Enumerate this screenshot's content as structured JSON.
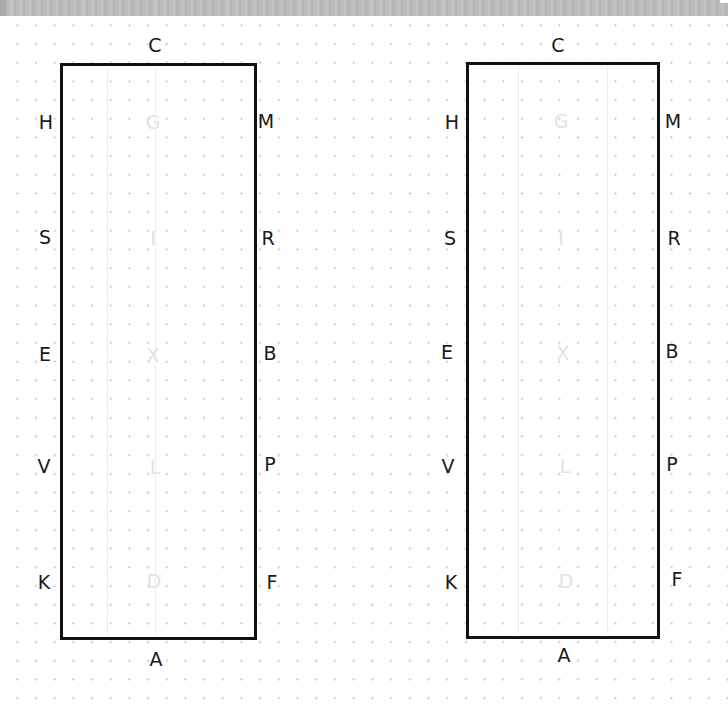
{
  "title_bar": {
    "visible": true
  },
  "arenas": [
    {
      "name": "arena-left",
      "outer_letters": {
        "top": "C",
        "bottom": "A",
        "left": [
          "H",
          "S",
          "E",
          "V",
          "K"
        ],
        "right": [
          "M",
          "R",
          "B",
          "P",
          "F"
        ]
      },
      "centerline_letters": [
        "G",
        "I",
        "X",
        "L",
        "D"
      ]
    },
    {
      "name": "arena-right",
      "outer_letters": {
        "top": "C",
        "bottom": "A",
        "left": [
          "H",
          "S",
          "E",
          "V",
          "K"
        ],
        "right": [
          "M",
          "R",
          "B",
          "P",
          "F"
        ]
      },
      "centerline_letters": [
        "G",
        "I",
        "X",
        "L",
        "D"
      ]
    }
  ],
  "colors": {
    "arena_border": "#111111",
    "letter": "#1a1a1a",
    "faint_letter": "#e2e2e2",
    "dot_grid": "#d4d4d4"
  }
}
